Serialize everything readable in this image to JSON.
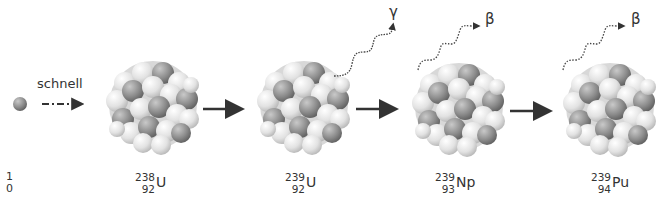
{
  "diagram": {
    "incoming": {
      "label": "schnell",
      "particle": "neutron",
      "mass": "1",
      "charge": "0"
    },
    "nuclides": [
      {
        "mass": "238",
        "charge": "92",
        "symbol": "U"
      },
      {
        "mass": "239",
        "charge": "92",
        "symbol": "U"
      },
      {
        "mass": "239",
        "charge": "93",
        "symbol": "Np"
      },
      {
        "mass": "239",
        "charge": "94",
        "symbol": "Pu"
      }
    ],
    "emissions": [
      {
        "symbol": "γ",
        "type": "gamma"
      },
      {
        "symbol": "β",
        "type": "beta"
      },
      {
        "symbol": "β",
        "type": "beta"
      }
    ],
    "colors": {
      "light_nucleon": "#e6e6e6",
      "dark_nucleon": "#8a8a8a",
      "arrow": "#333333",
      "text": "#333333"
    }
  }
}
